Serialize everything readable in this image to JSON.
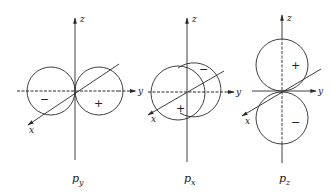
{
  "diagram": {
    "title": "",
    "colors": {
      "line": "#2a2a2a",
      "background": "#ffffff"
    },
    "panels": [
      {
        "id": "py",
        "label_main": "p",
        "label_sub": "y",
        "axes": {
          "z": "z",
          "y": "y",
          "x": "x"
        },
        "lobes": [
          {
            "sign": "−",
            "position": "negative y"
          },
          {
            "sign": "+",
            "position": "positive y"
          }
        ]
      },
      {
        "id": "px",
        "label_main": "p",
        "label_sub": "x",
        "axes": {
          "z": "z",
          "y": "y",
          "x": "x"
        },
        "lobes": [
          {
            "sign": "−",
            "position": "negative x (behind)"
          },
          {
            "sign": "+",
            "position": "positive x (front)"
          }
        ]
      },
      {
        "id": "pz",
        "label_main": "p",
        "label_sub": "z",
        "axes": {
          "z": "z",
          "y": "y",
          "x": "x"
        },
        "lobes": [
          {
            "sign": "+",
            "position": "positive z"
          },
          {
            "sign": "−",
            "position": "negative z"
          }
        ]
      }
    ]
  }
}
